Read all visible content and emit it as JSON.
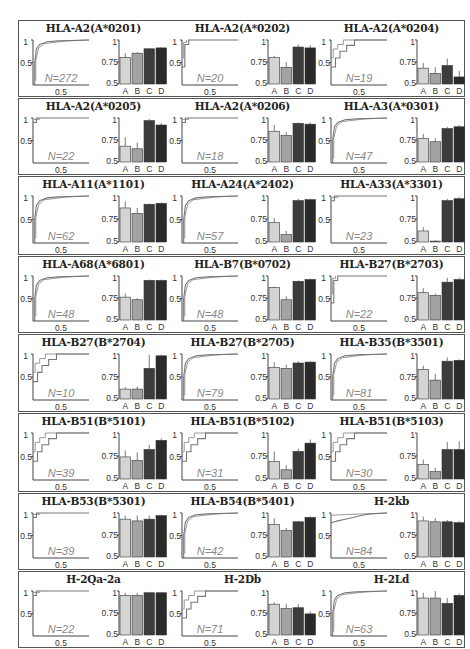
{
  "chart_data": {
    "type": "bar",
    "bar_categories": [
      "A",
      "B",
      "C",
      "D"
    ],
    "bar_colors": [
      "#d4d4d4",
      "#a3a3a3",
      "#3c3c3c",
      "#2a2a2a"
    ],
    "bar_ylim": [
      0.5,
      1
    ],
    "bar_yticks": [
      "0.5",
      "0.75",
      "1"
    ],
    "step_xtick": "0.5",
    "step_yticks": [
      "0.5",
      "1"
    ],
    "panels": [
      {
        "title": "HLA-A2(A*0201)",
        "n": "N=272",
        "values": [
          0.8,
          0.85,
          0.9,
          0.91
        ],
        "err": [
          0.05,
          0.01,
          0.01,
          0.01
        ],
        "curve": "steep"
      },
      {
        "title": "HLA-A2(A*0202)",
        "n": "N=20",
        "values": [
          0.8,
          0.69,
          0.92,
          0.91
        ],
        "err": [
          0.02,
          0.06,
          0.03,
          0.03
        ],
        "curve": "jump"
      },
      {
        "title": "HLA-A2(A*0204)",
        "n": "N=19",
        "values": [
          0.68,
          0.62,
          0.71,
          0.58
        ],
        "err": [
          0.06,
          0.07,
          0.08,
          0.07
        ],
        "curve": "stairs"
      },
      {
        "title": "HLA-A2(A*0205)",
        "n": "N=22",
        "values": [
          0.68,
          0.65,
          0.97,
          0.92
        ],
        "err": [
          0.1,
          0.07,
          0.02,
          0.02
        ],
        "curve": "flat"
      },
      {
        "title": "HLA-A2(A*0206)",
        "n": "N=18",
        "values": [
          0.85,
          0.8,
          0.94,
          0.93
        ],
        "err": [
          0.07,
          0.04,
          0.01,
          0.02
        ],
        "curve": "flat"
      },
      {
        "title": "HLA-A3(A*0301)",
        "n": "N=47",
        "values": [
          0.77,
          0.73,
          0.88,
          0.9
        ],
        "err": [
          0.05,
          0.04,
          0.02,
          0.02
        ],
        "curve": "steep"
      },
      {
        "title": "HLA-A11(A*1101)",
        "n": "N=62",
        "values": [
          0.87,
          0.81,
          0.91,
          0.92
        ],
        "err": [
          0.07,
          0.06,
          0.01,
          0.01
        ],
        "curve": "steep"
      },
      {
        "title": "HLA-A24(A*2402)",
        "n": "N=57",
        "values": [
          0.71,
          0.58,
          0.95,
          0.96
        ],
        "err": [
          0.05,
          0.04,
          0.02,
          0.01
        ],
        "curve": "steep"
      },
      {
        "title": "HLA-A33(A*3301)",
        "n": "N=23",
        "values": [
          0.62,
          0.51,
          0.95,
          0.97
        ],
        "err": [
          0.04,
          0.01,
          0.02,
          0.02
        ],
        "curve": "flat"
      },
      {
        "title": "HLA-A68(A*6801)",
        "n": "N=48",
        "values": [
          0.76,
          0.73,
          0.95,
          0.95
        ],
        "err": [
          0.04,
          0.02,
          0.01,
          0.01
        ],
        "curve": "steep"
      },
      {
        "title": "HLA-B7(B*0702)",
        "n": "N=48",
        "values": [
          0.87,
          0.73,
          0.94,
          0.96
        ],
        "err": [
          0.01,
          0.04,
          0.01,
          0.01
        ],
        "curve": "steep"
      },
      {
        "title": "HLA-B27(B*2703)",
        "n": "N=22",
        "values": [
          0.81,
          0.78,
          0.93,
          0.96
        ],
        "err": [
          0.05,
          0.02,
          0.05,
          0.02
        ],
        "curve": "jump"
      },
      {
        "title": "HLA-B27(B*2704)",
        "n": "N=10",
        "values": [
          0.61,
          0.61,
          0.84,
          0.98
        ],
        "err": [
          0.02,
          0.03,
          0.15,
          0.01
        ],
        "curve": "stairs"
      },
      {
        "title": "HLA-B27(B*2705)",
        "n": "N=79",
        "values": [
          0.85,
          0.84,
          0.9,
          0.91
        ],
        "err": [
          0.06,
          0.04,
          0.02,
          0.01
        ],
        "curve": "steep"
      },
      {
        "title": "HLA-B35(B*3501)",
        "n": "N=81",
        "values": [
          0.83,
          0.71,
          0.92,
          0.93
        ],
        "err": [
          0.04,
          0.07,
          0.04,
          0.01
        ],
        "curve": "steep"
      },
      {
        "title": "HLA-B51(B*5101)",
        "n": "N=39",
        "values": [
          0.74,
          0.7,
          0.82,
          0.92
        ],
        "err": [
          0.07,
          0.09,
          0.05,
          0.02
        ],
        "curve": "stairs"
      },
      {
        "title": "HLA-B51(B*5102)",
        "n": "N=31",
        "values": [
          0.69,
          0.6,
          0.8,
          0.89
        ],
        "err": [
          0.11,
          0.05,
          0.03,
          0.04
        ],
        "curve": "stairs"
      },
      {
        "title": "HLA-B51(B*5103)",
        "n": "N=30",
        "values": [
          0.66,
          0.58,
          0.82,
          0.82
        ],
        "err": [
          0.05,
          0.04,
          0.08,
          0.09
        ],
        "curve": "stairs"
      },
      {
        "title": "HLA-B53(B*5301)",
        "n": "N=39",
        "values": [
          0.93,
          0.91,
          0.93,
          0.97
        ],
        "err": [
          0.04,
          0.06,
          0.04,
          0.01
        ],
        "curve": "flat"
      },
      {
        "title": "HLA-B54(B*5401)",
        "n": "N=42",
        "values": [
          0.87,
          0.8,
          0.9,
          0.95
        ],
        "err": [
          0.07,
          0.03,
          0.01,
          0.01
        ],
        "curve": "steep"
      },
      {
        "title": "H-2kb",
        "n": "N=84",
        "values": [
          0.91,
          0.9,
          0.9,
          0.89
        ],
        "err": [
          0.05,
          0.04,
          0.02,
          0.02
        ],
        "curve": "gradual"
      },
      {
        "title": "H-2Qa-2a",
        "n": "N=22",
        "values": [
          0.95,
          0.95,
          0.98,
          0.98
        ],
        "err": [
          0.03,
          0.03,
          0.01,
          0.01
        ],
        "curve": "flat"
      },
      {
        "title": "H-2Db",
        "n": "N=71",
        "values": [
          0.85,
          0.8,
          0.81,
          0.74
        ],
        "err": [
          0.02,
          0.05,
          0.04,
          0.03
        ],
        "curve": "stairs"
      },
      {
        "title": "H-2Ld",
        "n": "N=63",
        "values": [
          0.92,
          0.92,
          0.86,
          0.95
        ],
        "err": [
          0.06,
          0.08,
          0.06,
          0.02
        ],
        "curve": "steep"
      }
    ]
  }
}
